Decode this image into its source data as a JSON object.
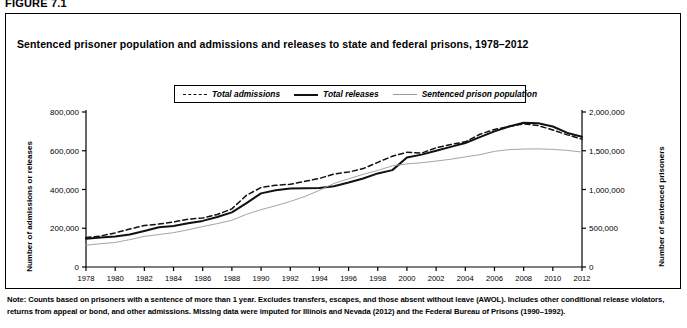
{
  "figure": {
    "label": "FIGURE 7.1",
    "title": "Sentenced prisoner population and admissions and releases to state and federal prisons, 1978–2012"
  },
  "note": {
    "text": "Note: Counts based on prisoners with a sentence of more than 1 year. Excludes transfers, escapes, and those absent without leave (AWOL). Includes other conditional release violators, returns from appeal or bond, and other admissions. Missing data were imputed for Illinois and Nevada (2012) and the Federal Bureau of Prisons (1990–1992)."
  },
  "legend": {
    "position": "top-center",
    "items": [
      {
        "label": "Total admissions",
        "style": "dashed",
        "color": "#111111"
      },
      {
        "label": "Total releases",
        "style": "solid",
        "color": "#111111"
      },
      {
        "label": "Sentenced prison population",
        "style": "thin",
        "color": "#9a9a9a"
      }
    ]
  },
  "chart_data": {
    "type": "line",
    "title": "Sentenced prisoner population and admissions and releases to state and federal prisons, 1978–2012",
    "xlabel": "",
    "ylabel": "Number of admissions or releases",
    "y2label": "Number of sentenced prisoners",
    "xlim": [
      1978,
      2012
    ],
    "ylim": [
      0,
      800000
    ],
    "y2lim": [
      0,
      2000000
    ],
    "grid": false,
    "x_ticks": [
      1978,
      1980,
      1982,
      1984,
      1986,
      1988,
      1990,
      1992,
      1994,
      1996,
      1998,
      2000,
      2002,
      2004,
      2006,
      2008,
      2010,
      2012
    ],
    "x_tick_labels": [
      "1978",
      "1980",
      "1982",
      "1984",
      "1986",
      "1988",
      "1990",
      "1992",
      "1994",
      "1996",
      "1998",
      "2000",
      "2002",
      "2004",
      "2006",
      "2008",
      "2010",
      "2012"
    ],
    "y_ticks": [
      0,
      200000,
      400000,
      600000,
      800000
    ],
    "y_tick_labels": [
      "0",
      "200,000",
      "400,000",
      "600,000",
      "800,000"
    ],
    "y2_ticks": [
      0,
      500000,
      1000000,
      1500000,
      2000000
    ],
    "y2_tick_labels": [
      "0",
      "500,000",
      "1,000,000",
      "1,500,000",
      "2,000,000"
    ],
    "x": [
      1978,
      1979,
      1980,
      1981,
      1982,
      1983,
      1984,
      1985,
      1986,
      1987,
      1988,
      1989,
      1990,
      1991,
      1992,
      1993,
      1994,
      1995,
      1996,
      1997,
      1998,
      1999,
      2000,
      2001,
      2002,
      2003,
      2004,
      2005,
      2006,
      2007,
      2008,
      2009,
      2010,
      2011,
      2012
    ],
    "series": [
      {
        "name": "Total admissions",
        "axis": "left",
        "style": "dashed",
        "color": "#111111",
        "values": [
          152000,
          160000,
          176000,
          196000,
          214000,
          222000,
          232000,
          247000,
          253000,
          271000,
          300000,
          370000,
          410000,
          422000,
          427000,
          442000,
          457000,
          480000,
          490000,
          508000,
          540000,
          572000,
          592000,
          588000,
          615000,
          632000,
          646000,
          685000,
          710000,
          725000,
          739000,
          730000,
          707000,
          682000,
          660000
        ]
      },
      {
        "name": "Total releases",
        "axis": "left",
        "style": "solid",
        "color": "#111111",
        "values": [
          146000,
          152000,
          158000,
          168000,
          186000,
          205000,
          212000,
          226000,
          238000,
          258000,
          282000,
          330000,
          380000,
          396000,
          405000,
          406000,
          408000,
          417000,
          436000,
          457000,
          483000,
          500000,
          565000,
          580000,
          600000,
          620000,
          640000,
          670000,
          700000,
          725000,
          745000,
          742000,
          725000,
          692000,
          672000
        ]
      },
      {
        "name": "Sentenced prison population",
        "axis": "right",
        "style": "thin",
        "color": "#9a9a9a",
        "values": [
          280000,
          301000,
          316000,
          353000,
          395000,
          419000,
          443000,
          480000,
          522000,
          560000,
          603000,
          680000,
          740000,
          790000,
          846000,
          909000,
          990000,
          1078000,
          1138000,
          1195000,
          1246000,
          1305000,
          1331000,
          1345000,
          1367000,
          1390000,
          1421000,
          1449000,
          1492000,
          1514000,
          1522000,
          1524000,
          1518000,
          1504000,
          1483000
        ]
      }
    ],
    "annotations": []
  }
}
